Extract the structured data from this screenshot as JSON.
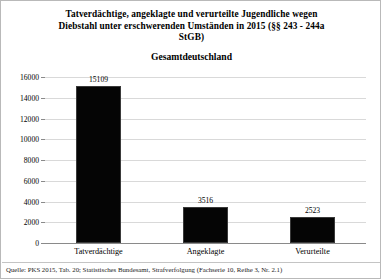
{
  "chart_data": {
    "type": "bar",
    "title": "Tatverdächtige, angeklagte und verurteilte Jugendliche wegen Diebstahl unter erschwerenden Umständen in 2015 (§§ 243 - 244a StGB)",
    "title_lines": [
      "Tatverdächtige, angeklagte und verurteilte Jugendliche wegen",
      "Diebstahl unter erschwerenden Umständen in 2015 (§§ 243 - 244a",
      "StGB)"
    ],
    "subtitle": "Gesamtdeutschland",
    "categories": [
      "Tatverdächtige",
      "Angeklagte",
      "Verurteilte"
    ],
    "values": [
      15109,
      3516,
      2523
    ],
    "value_labels": [
      "15109",
      "3516",
      "2523"
    ],
    "xlabel": "",
    "ylabel": "",
    "ylim": [
      0,
      16000
    ],
    "ytick_step": 2000,
    "ytick_labels": [
      "16000",
      "14000",
      "12000",
      "10000",
      "8000",
      "6000",
      "4000",
      "2000",
      "0"
    ],
    "ytick_values": [
      16000,
      14000,
      12000,
      10000,
      8000,
      6000,
      4000,
      2000,
      0
    ],
    "grid": true,
    "legend": false,
    "bar_color": "#050505",
    "grid_color": "#d9d9d9",
    "axis_color": "#8a8a8a",
    "source_note": "Quelle: PKS 2015, Tab. 20; Statistisches Bundesamt, Strafverfolgung (Fachserie 10, Reihe 3, Nr. 2.1)"
  }
}
